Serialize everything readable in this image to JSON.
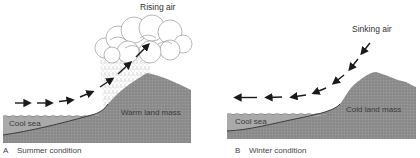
{
  "panels": {
    "a": {
      "letter": "A",
      "caption": "Summer condition",
      "air_label": "Rising air",
      "sea_label": "Cool sea",
      "land_label": "Warm land mass",
      "air_direction": "onshore-rising"
    },
    "b": {
      "letter": "B",
      "caption": "Winter condition",
      "air_label": "Sinking air",
      "sea_label": "Cool sea",
      "land_label": "Cold land mass",
      "air_direction": "offshore-sinking"
    }
  },
  "colors": {
    "land": "#8f8f8f",
    "sea": "#a9a9a9",
    "seabed_line": "#2a2a2a",
    "arrow": "#1a1a1a",
    "cloud_stroke": "#9a9a9a",
    "text": "#333333"
  }
}
